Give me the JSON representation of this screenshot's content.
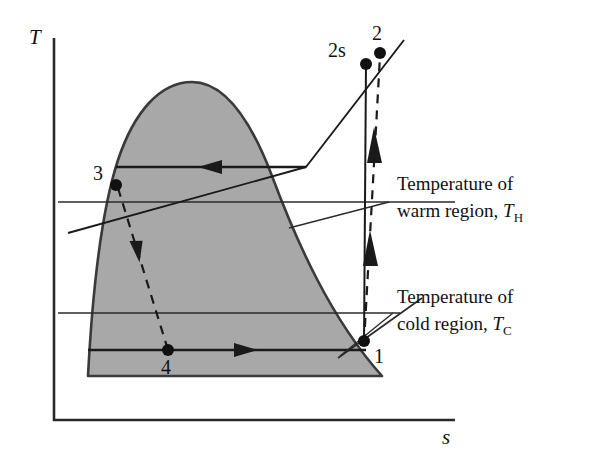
{
  "figure": {
    "type": "thermodynamic-ts-diagram",
    "background_color": "#ffffff",
    "line_color": "#1a1a1a",
    "dome_fill_color": "#a8a8a8",
    "dome_edge_color": "#333333"
  },
  "axes": {
    "y_label": "T",
    "x_label": "s",
    "origin": {
      "x": 54,
      "y": 420
    },
    "y_top": {
      "x": 54,
      "y": 38
    },
    "x_right": {
      "x": 455,
      "y": 420
    }
  },
  "annotations": [
    {
      "id": "warm-region",
      "line1": "Temperature of",
      "line2_prefix": "warm region, ",
      "line2_var": "T",
      "line2_sub": "H",
      "x": 397,
      "y1": 190,
      "y2": 217,
      "leader_line": {
        "x1": 290,
        "y1": 228,
        "x2": 389,
        "y2": 202
      },
      "ref_line_y": 202
    },
    {
      "id": "cold-region",
      "line1": "Temperature of",
      "line2_prefix": "cold region, ",
      "line2_var": "T",
      "line2_sub": "C",
      "x": 397,
      "y1": 303,
      "y2": 330,
      "leader_line": {
        "x1": 355,
        "y1": 345,
        "x2": 389,
        "y2": 313
      },
      "ref_line_y": 313
    }
  ],
  "reference_lines": [
    {
      "name": "T_H-isotherm",
      "y": 202,
      "x1": 58,
      "x2": 455
    },
    {
      "name": "T_C-isotherm",
      "y": 313,
      "x1": 58,
      "x2": 400
    }
  ],
  "states": [
    {
      "label": "1",
      "x": 364,
      "y": 341,
      "label_dx": 10,
      "label_dy": 22
    },
    {
      "label": "2",
      "x": 380,
      "y": 53,
      "label_dx": -4,
      "label_dy": -12
    },
    {
      "label": "2s",
      "x": 366,
      "y": 64,
      "label_dx": -38,
      "label_dy": -6
    },
    {
      "label": "3",
      "x": 116,
      "y": 185,
      "label_dx": -22,
      "label_dy": -6
    },
    {
      "label": "4",
      "x": 168,
      "y": 350,
      "label_dx": -6,
      "label_dy": 24
    }
  ],
  "processes": [
    {
      "name": "compression-isentropic-1-2s",
      "from": "1",
      "to": "2s",
      "style": "solid",
      "path": "M 364 341 L 366 64"
    },
    {
      "name": "compression-actual-1-2",
      "from": "1",
      "to": "2",
      "style": "dashed",
      "path": "M 364 341 L 380 53",
      "arrows": 2
    },
    {
      "name": "condenser-heat-rejection-2-3",
      "from": "2",
      "to": "3",
      "style": "solid",
      "direction": "left",
      "path": "M 306 167 L 116 167"
    },
    {
      "name": "expansion-valve-3-4",
      "from": "3",
      "to": "4",
      "style": "dashed",
      "direction": "down",
      "path": "M 120 190 L 168 350"
    },
    {
      "name": "evaporator-heat-absorption-4-1",
      "from": "4",
      "to": "1",
      "style": "solid",
      "direction": "right",
      "path": "M 88 350 L 364 350"
    }
  ],
  "dome": {
    "name": "saturation-dome",
    "peak": {
      "x": 192,
      "y": 82
    },
    "left_foot": {
      "x": 88,
      "y": 376
    },
    "right_foot": {
      "x": 382,
      "y": 376
    }
  },
  "constant_pressure_lines": [
    {
      "name": "high-pressure-line",
      "path": "M 68 233 L 306 167 L 404 40"
    },
    {
      "name": "low-pressure-line",
      "path": "M 340 356 L 420 300"
    }
  ]
}
